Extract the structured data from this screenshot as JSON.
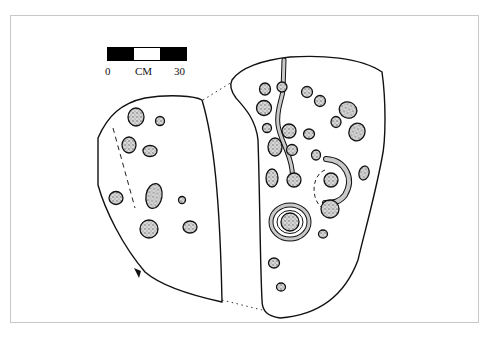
{
  "figure": {
    "scale_bar": {
      "unit": "CM",
      "start_label": "0",
      "end_label": "30",
      "segments": [
        "black",
        "white",
        "black"
      ]
    },
    "colors": {
      "line": "#111111",
      "stipple_fill": "#9a9a9a",
      "frame": "#c8c8c8",
      "background": "#ffffff"
    },
    "left_slab": {
      "cup_marks": 9,
      "dashed_line": true,
      "north_arrow": true
    },
    "right_slab": {
      "cup_marks": 27,
      "ring_marks": 1,
      "channels": 2,
      "dashed_arc": true
    }
  }
}
